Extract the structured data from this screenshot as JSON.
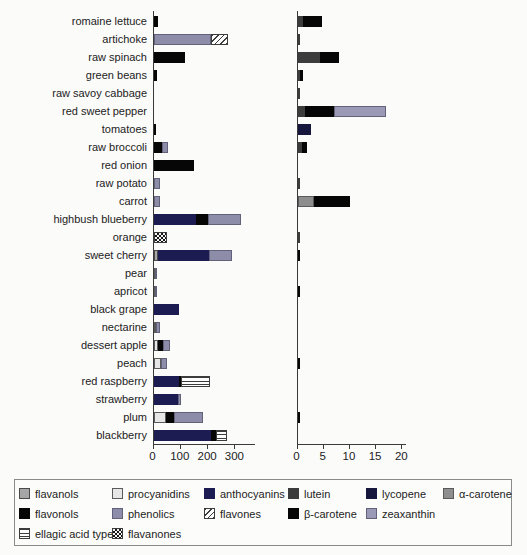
{
  "chart_data": {
    "type": "bar",
    "orientation": "horizontal",
    "title": "",
    "grid": false,
    "panels": {
      "left": {
        "ticks": [
          0,
          100,
          200,
          300
        ],
        "xlim": [
          0,
          375
        ]
      },
      "right": {
        "ticks": [
          0,
          5,
          10,
          15,
          20
        ],
        "xlim": [
          0,
          20.8
        ]
      }
    },
    "palette": {
      "flavanols": {
        "label": "flavanols",
        "color": "#a6a6a6",
        "pattern": "solid",
        "border": "#4a4a4a"
      },
      "procyanidins": {
        "label": "procyanidins",
        "color": "#e6e6e6",
        "pattern": "solid",
        "border": "#5a5a5a"
      },
      "anthocyanins": {
        "label": "anthocyanins",
        "color": "#1c1c52",
        "pattern": "solid",
        "border": "#1c1c52"
      },
      "lutein": {
        "label": "lutein",
        "color": "#3c3c3c",
        "pattern": "solid",
        "border": "#3c3c3c"
      },
      "lycopene": {
        "label": "lycopene",
        "color": "#17173d",
        "pattern": "solid",
        "border": "#17173d"
      },
      "alpha_carotene": {
        "label": "α-carotene",
        "color": "#8e8e8e",
        "pattern": "solid",
        "border": "#5a5a5a"
      },
      "flavonols": {
        "label": "flavonols",
        "color": "#060606",
        "pattern": "solid",
        "border": "#060606"
      },
      "phenolics": {
        "label": "phenolics",
        "color": "#8d8da9",
        "pattern": "solid",
        "border": "#61617a"
      },
      "flavones": {
        "label": "flavones",
        "color": "#ffffff",
        "pattern": "diag",
        "border": "#3c3c3c"
      },
      "beta_carotene": {
        "label": "β-carotene",
        "color": "#060606",
        "pattern": "solid",
        "border": "#060606"
      },
      "zeaxanthin": {
        "label": "zeaxanthin",
        "color": "#9a9ab6",
        "pattern": "solid",
        "border": "#61617a"
      },
      "ellagic_acid_type": {
        "label": "ellagic acid type",
        "color": "#ffffff",
        "pattern": "hlines",
        "border": "#3c3c3c"
      },
      "flavanones": {
        "label": "flavanones",
        "color": "#ffffff",
        "pattern": "checker",
        "border": "#3c3c3c"
      }
    },
    "legend_rows": [
      [
        "flavanols",
        "procyanidins",
        "anthocyanins",
        "lutein",
        "lycopene",
        "alpha_carotene"
      ],
      [
        "flavonols",
        "phenolics",
        "flavones",
        "beta_carotene",
        "zeaxanthin"
      ],
      [
        "ellagic_acid_type",
        "flavanones"
      ]
    ],
    "rows": [
      {
        "label": "romaine lettuce",
        "left": [
          [
            "flavonols",
            15
          ]
        ],
        "right": [
          [
            "lutein",
            1.0
          ],
          [
            "beta_carotene",
            3.7
          ]
        ]
      },
      {
        "label": "artichoke",
        "left": [
          [
            "phenolics",
            212
          ],
          [
            "flavones",
            62
          ]
        ],
        "right": [
          [
            "lutein",
            0.3
          ]
        ]
      },
      {
        "label": "raw spinach",
        "left": [
          [
            "flavonols",
            117
          ]
        ],
        "right": [
          [
            "lutein",
            4.3
          ],
          [
            "beta_carotene",
            3.6
          ]
        ]
      },
      {
        "label": "green beans",
        "left": [
          [
            "flavonols",
            12
          ]
        ],
        "right": [
          [
            "lutein",
            0.5
          ],
          [
            "beta_carotene",
            0.5
          ]
        ]
      },
      {
        "label": "raw savoy cabbage",
        "left": [],
        "right": [
          [
            "lutein",
            0.2
          ]
        ]
      },
      {
        "label": "red sweet pepper",
        "left": [],
        "right": [
          [
            "lutein",
            1.4
          ],
          [
            "beta_carotene",
            5.5
          ],
          [
            "zeaxanthin",
            10.0
          ]
        ]
      },
      {
        "label": "tomatoes",
        "left": [
          [
            "flavonols",
            6
          ]
        ],
        "right": [
          [
            "lycopene",
            2.5
          ]
        ]
      },
      {
        "label": "raw broccoli",
        "left": [
          [
            "flavonols",
            31
          ],
          [
            "phenolics",
            22
          ]
        ],
        "right": [
          [
            "lutein",
            0.9
          ],
          [
            "beta_carotene",
            0.9
          ]
        ]
      },
      {
        "label": "red onion",
        "left": [
          [
            "flavonols",
            148
          ]
        ],
        "right": []
      },
      {
        "label": "raw potato",
        "left": [
          [
            "phenolics",
            25
          ]
        ],
        "right": [
          [
            "lutein",
            0.1
          ]
        ]
      },
      {
        "label": "carrot",
        "left": [
          [
            "phenolics",
            22
          ]
        ],
        "right": [
          [
            "alpha_carotene",
            3.2
          ],
          [
            "beta_carotene",
            6.8
          ]
        ]
      },
      {
        "label": "highbush blueberry",
        "left": [
          [
            "anthocyanins",
            157
          ],
          [
            "flavonols",
            43
          ],
          [
            "phenolics",
            120
          ]
        ],
        "right": []
      },
      {
        "label": "orange",
        "left": [
          [
            "flavanones",
            50
          ]
        ],
        "right": [
          [
            "lutein",
            0.2
          ]
        ]
      },
      {
        "label": "sweet cherry",
        "left": [
          [
            "flavanols",
            15
          ],
          [
            "anthocyanins",
            188
          ],
          [
            "phenolics",
            85
          ]
        ],
        "right": [
          [
            "beta_carotene",
            0.15
          ]
        ]
      },
      {
        "label": "pear",
        "left": [
          [
            "procyanidins",
            5
          ],
          [
            "phenolics",
            9
          ]
        ],
        "right": []
      },
      {
        "label": "apricot",
        "left": [
          [
            "procyanidins",
            4
          ],
          [
            "phenolics",
            9
          ]
        ],
        "right": [
          [
            "beta_carotene",
            0.4
          ]
        ]
      },
      {
        "label": "black grape",
        "left": [
          [
            "anthocyanins",
            95
          ]
        ],
        "right": []
      },
      {
        "label": "nectarine",
        "left": [
          [
            "procyanidins",
            10
          ],
          [
            "phenolics",
            14
          ]
        ],
        "right": []
      },
      {
        "label": "dessert apple",
        "left": [
          [
            "procyanidins",
            18
          ],
          [
            "flavonols",
            18
          ],
          [
            "phenolics",
            25
          ]
        ],
        "right": []
      },
      {
        "label": "peach",
        "left": [
          [
            "procyanidins",
            27
          ],
          [
            "phenolics",
            24
          ]
        ],
        "right": [
          [
            "beta_carotene",
            0.2
          ]
        ]
      },
      {
        "label": "red raspberry",
        "left": [
          [
            "anthocyanins",
            92
          ],
          [
            "flavonols",
            10
          ],
          [
            "ellagic_acid_type",
            105
          ]
        ],
        "right": []
      },
      {
        "label": "strawberry",
        "left": [
          [
            "anthocyanins",
            90
          ],
          [
            "phenolics",
            12
          ]
        ],
        "right": []
      },
      {
        "label": "plum",
        "left": [
          [
            "procyanidins",
            45
          ],
          [
            "flavonols",
            30
          ],
          [
            "phenolics",
            105
          ]
        ],
        "right": [
          [
            "beta_carotene",
            0.2
          ]
        ]
      },
      {
        "label": "blackberry",
        "left": [
          [
            "anthocyanins",
            210
          ],
          [
            "flavonols",
            18
          ],
          [
            "ellagic_acid_type",
            42
          ]
        ],
        "right": []
      }
    ]
  }
}
